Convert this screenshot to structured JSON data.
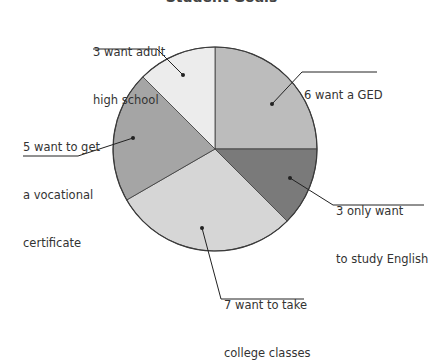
{
  "chart_data": {
    "type": "pie",
    "title": "Student Goals",
    "total": 24,
    "start_angle_deg": -90,
    "direction": "clockwise",
    "center": [
      215,
      149
    ],
    "radius": 102,
    "slices": [
      {
        "key": "ged",
        "label": "6 want a GED",
        "value": 6,
        "color": "#bcbcbc"
      },
      {
        "key": "english",
        "label": "3 only want to study English",
        "value": 3,
        "color": "#7a7a7a"
      },
      {
        "key": "college",
        "label": "7 want to take college classes",
        "value": 7,
        "color": "#d6d6d6"
      },
      {
        "key": "vocational",
        "label": "5 want to get a vocational certificate",
        "value": 5,
        "color": "#a5a5a5"
      },
      {
        "key": "adult_hs",
        "label": "3 want adult high school",
        "value": 3,
        "color": "#ececec"
      }
    ],
    "legend": "none (callout labels)"
  },
  "labels": {
    "adult_hs": {
      "line1": "3 want adult",
      "line2": "high school"
    },
    "ged": {
      "line1": "6 want a GED"
    },
    "vocational": {
      "line1": "5 want to get",
      "line2": "a vocational",
      "line3": "certificate"
    },
    "english": {
      "line1": "3 only want",
      "line2": "to study English"
    },
    "college": {
      "line1": "7 want to take",
      "line2": "college classes"
    }
  }
}
